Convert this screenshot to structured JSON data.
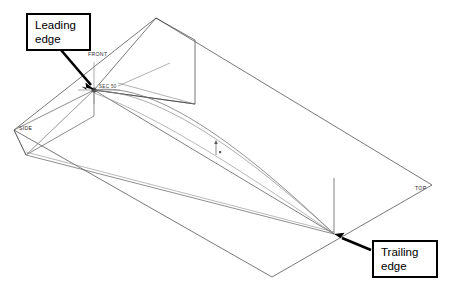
{
  "diagram": {
    "kind": "cad-wireframe-wing",
    "background_color": "#ffffff",
    "line_color": "#000000",
    "faint_line_color": "#9a9a9a",
    "mid_line_color": "#6e6e6e"
  },
  "callouts": [
    {
      "id": "leading-edge",
      "line1": "Leading",
      "line2": "edge",
      "box": {
        "x": 26,
        "y": 13,
        "w": 65,
        "h": 38
      },
      "arrow": {
        "x1": 63,
        "y1": 52,
        "x2": 95,
        "y2": 88
      }
    },
    {
      "id": "trailing-edge",
      "line1": "Trailing",
      "line2": "edge",
      "box": {
        "x": 372,
        "y": 240,
        "w": 66,
        "h": 38
      },
      "arrow": {
        "x1": 370,
        "y1": 249,
        "x2": 336,
        "y2": 235
      }
    }
  ],
  "plane_tags": [
    {
      "id": "front",
      "label": "FRONT",
      "x": 88,
      "y": 51
    },
    {
      "id": "side",
      "label": "SIDE",
      "x": 19,
      "y": 125
    },
    {
      "id": "top",
      "label": "TOP",
      "x": 415,
      "y": 185
    },
    {
      "id": "section",
      "label": "SEC 50",
      "x": 99,
      "y": 84
    }
  ],
  "geometry": {
    "leading_edge_point": {
      "x": 94,
      "y": 90
    },
    "trailing_edge_point": {
      "x": 334,
      "y": 234
    },
    "top_plane": [
      {
        "x": 14,
        "y": 130
      },
      {
        "x": 156,
        "y": 18
      },
      {
        "x": 432,
        "y": 185
      },
      {
        "x": 272,
        "y": 277
      }
    ],
    "front_plane": [
      {
        "x": 94,
        "y": 90
      },
      {
        "x": 156,
        "y": 18
      },
      {
        "x": 195,
        "y": 40
      },
      {
        "x": 195,
        "y": 104
      }
    ],
    "side_plane": [
      {
        "x": 14,
        "y": 130
      },
      {
        "x": 94,
        "y": 90
      },
      {
        "x": 94,
        "y": 114
      },
      {
        "x": 77,
        "y": 160
      }
    ],
    "origin_marker": {
      "x": 216,
      "y": 148
    }
  }
}
